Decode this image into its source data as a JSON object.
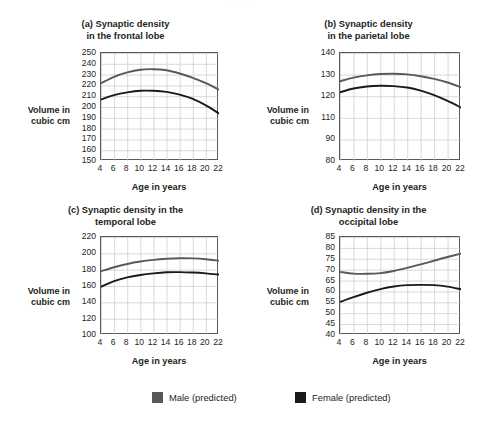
{
  "figure": {
    "top_artifact": "· ·",
    "y_caption_line1": "Volume in",
    "y_caption_line2": "cubic cm",
    "x_caption": "Age in years"
  },
  "legend": {
    "items": [
      {
        "label": "Male (predicted)",
        "color": "#58595b",
        "key": "male"
      },
      {
        "label": "Female (predicted)",
        "color": "#1a1a1a",
        "key": "female"
      }
    ]
  },
  "chart_data": [
    {
      "id": "a",
      "type": "line",
      "title": "(a) Synaptic density in the frontal lobe",
      "title_line1": "(a) Synaptic density",
      "title_line2": "in the frontal lobe",
      "xlabel": "Age in years",
      "ylabel": "Volume in cubic cm",
      "x": [
        4,
        6,
        8,
        10,
        12,
        14,
        16,
        18,
        20,
        22
      ],
      "xticks": [
        "4",
        "6",
        "8",
        "10",
        "12",
        "14",
        "16",
        "18",
        "20",
        "22"
      ],
      "yticks": [
        "250",
        "240",
        "230",
        "220",
        "210",
        "200",
        "190",
        "180",
        "170",
        "160",
        "150"
      ],
      "xlim": [
        4,
        22
      ],
      "ylim": [
        150,
        250
      ],
      "grid": true,
      "series": [
        {
          "name": "Male (predicted)",
          "color": "#58595b",
          "values": [
            222,
            228,
            232,
            234.5,
            235,
            234,
            231,
            227,
            222,
            216
          ]
        },
        {
          "name": "Female (predicted)",
          "color": "#1a1a1a",
          "values": [
            207,
            211,
            213.5,
            215,
            215,
            214,
            211.5,
            207.5,
            201.5,
            194
          ]
        }
      ]
    },
    {
      "id": "b",
      "type": "line",
      "title": "(b) Synaptic density in the parietal lobe",
      "title_line1": "(b) Synaptic density",
      "title_line2": "in the parietal lobe",
      "xlabel": "Age in years",
      "ylabel": "Volume in cubic cm",
      "x": [
        4,
        6,
        8,
        10,
        12,
        14,
        16,
        18,
        20,
        22
      ],
      "xticks": [
        "4",
        "6",
        "8",
        "10",
        "12",
        "14",
        "16",
        "18",
        "20",
        "22"
      ],
      "yticks": [
        "140",
        "130",
        "120",
        "110",
        "90",
        "80"
      ],
      "xlim": [
        4,
        22
      ],
      "ylim": [
        80,
        140
      ],
      "grid": true,
      "series": [
        {
          "name": "Male (predicted)",
          "color": "#58595b",
          "values": [
            124.3,
            126.3,
            127.6,
            128.3,
            128.5,
            128.1,
            127.1,
            125.6,
            123.6,
            121
          ]
        },
        {
          "name": "Female (predicted)",
          "color": "#1a1a1a",
          "values": [
            118.2,
            120.3,
            121.4,
            121.8,
            121.6,
            120.8,
            119.1,
            116.6,
            113.4,
            109.7
          ]
        }
      ]
    },
    {
      "id": "c",
      "type": "line",
      "title": "(c) Synaptic density in the temporal lobe",
      "title_line1": "(c) Synaptic density in the",
      "title_line2": "temporal lobe",
      "xlabel": "Age in years",
      "ylabel": "Volume in cubic cm",
      "x": [
        4,
        6,
        8,
        10,
        12,
        14,
        16,
        18,
        20,
        22
      ],
      "xticks": [
        "4",
        "6",
        "8",
        "10",
        "12",
        "14",
        "16",
        "18",
        "20",
        "22"
      ],
      "yticks": [
        "220",
        "200",
        "180",
        "160",
        "140",
        "120",
        "100"
      ],
      "xlim": [
        4,
        22
      ],
      "ylim": [
        100,
        220
      ],
      "grid": true,
      "series": [
        {
          "name": "Male (predicted)",
          "color": "#58595b",
          "values": [
            178,
            183,
            187,
            190,
            192,
            193.3,
            194,
            193.8,
            192.8,
            191
          ]
        },
        {
          "name": "Female (predicted)",
          "color": "#1a1a1a",
          "values": [
            159,
            166,
            170.5,
            173.5,
            175.5,
            176.8,
            177,
            176.5,
            175.5,
            174
          ]
        }
      ]
    },
    {
      "id": "d",
      "type": "line",
      "title": "(d) Synaptic density in the occipital lobe",
      "title_line1": "(d) Synaptic density in the",
      "title_line2": "occipital lobe",
      "xlabel": "Age in years",
      "ylabel": "Volume in cubic cm",
      "x": [
        4,
        6,
        8,
        10,
        12,
        14,
        16,
        18,
        20,
        22
      ],
      "xticks": [
        "4",
        "6",
        "8",
        "10",
        "12",
        "14",
        "16",
        "18",
        "20",
        "22"
      ],
      "yticks": [
        "85",
        "80",
        "75",
        "70",
        "65",
        "60",
        "55",
        "50",
        "45",
        "40"
      ],
      "xlim": [
        4,
        22
      ],
      "ylim": [
        40,
        85
      ],
      "grid": true,
      "series": [
        {
          "name": "Male (predicted)",
          "color": "#58595b",
          "values": [
            69,
            68.2,
            68.1,
            68.4,
            69.4,
            70.8,
            72.4,
            74.1,
            75.8,
            77.4
          ]
        },
        {
          "name": "Female (predicted)",
          "color": "#1a1a1a",
          "values": [
            55.2,
            57.4,
            59.4,
            61.1,
            62.3,
            62.9,
            63,
            62.9,
            62.2,
            61
          ]
        }
      ]
    }
  ]
}
